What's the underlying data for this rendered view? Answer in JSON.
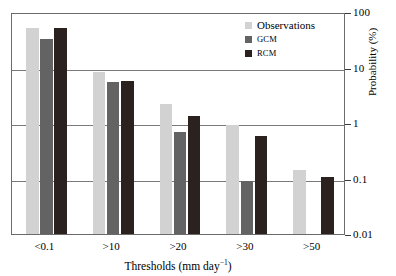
{
  "chart_data": {
    "type": "bar",
    "title": "",
    "xlabel": "Thresholds (mm day-1)",
    "xlabel_base": "Thresholds (mm day",
    "xlabel_sup": "-1",
    "xlabel_tail": ")",
    "ylabel": "Probability (%)",
    "yscale": "log",
    "ylim": [
      0.01,
      100
    ],
    "ytick_labels": [
      "100",
      "10",
      "1",
      "0.1",
      "0.01"
    ],
    "ytick_values": [
      100,
      10,
      1,
      0.1,
      0.01
    ],
    "grid": "horizontal",
    "legend_position": "top-right",
    "categories": [
      "<0.1",
      ">10",
      ">20",
      ">30",
      ">50"
    ],
    "series": [
      {
        "name": "Observations",
        "color": "#d2d2d2",
        "values": [
          52,
          8.2,
          2.2,
          0.93,
          0.145
        ]
      },
      {
        "name": "GCM",
        "color": "#636363",
        "values": [
          33,
          5.4,
          0.68,
          0.092,
          null
        ]
      },
      {
        "name": "RCM",
        "color": "#2b211e",
        "values": [
          52,
          5.6,
          1.35,
          0.58,
          0.108
        ]
      }
    ]
  },
  "legend": {
    "items": [
      {
        "label": "Observations",
        "color": "#d2d2d2"
      },
      {
        "label": "GCM",
        "color": "#636363"
      },
      {
        "label": "RCM",
        "color": "#2b211e"
      }
    ]
  },
  "axes": {
    "y_title": "Probability (%)",
    "y_ticks": [
      "100",
      "10",
      "1",
      "0.1",
      "0.01"
    ],
    "x_ticks": [
      "<0.1",
      ">10",
      ">20",
      ">30",
      ">50"
    ],
    "x_title_base": "Thresholds (mm day",
    "x_title_sup": "−1",
    "x_title_tail": ")"
  },
  "colors": {
    "observations": "#d2d2d2",
    "gcm": "#636363",
    "rcm": "#2b211e",
    "frame": "#6b6b6b",
    "grid": "#7a7a7a",
    "background": "#ffffff"
  }
}
